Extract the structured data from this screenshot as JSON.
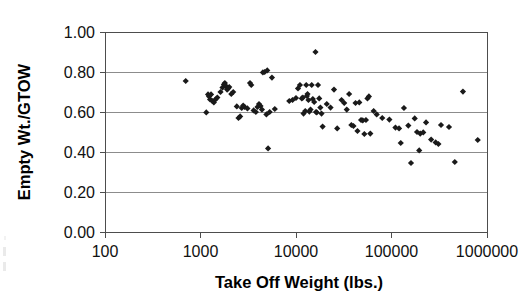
{
  "chart_data": {
    "type": "scatter",
    "title": "",
    "xlabel": "Take Off Weight (lbs.)",
    "ylabel": "Empty Wt./GTOW",
    "xscale": "log",
    "yscale": "linear",
    "xlim": [
      100,
      1000000
    ],
    "ylim": [
      0.0,
      1.0
    ],
    "xticks": [
      100,
      1000,
      10000,
      100000,
      1000000
    ],
    "xtick_labels": [
      "100",
      "1000",
      "10000",
      "100000",
      "1000000"
    ],
    "yticks": [
      0.0,
      0.2,
      0.4,
      0.6,
      0.8,
      1.0
    ],
    "ytick_labels": [
      "0.00",
      "0.20",
      "0.40",
      "0.60",
      "0.80",
      "1.00"
    ],
    "grid": "horizontal",
    "legend": "none",
    "marker": "filled-diamond",
    "marker_color": "#1a1a1a",
    "marker_size": 3.1,
    "series": [
      {
        "name": "Aircraft",
        "points": [
          [
            700,
            0.755
          ],
          [
            1150,
            0.598
          ],
          [
            1200,
            0.688
          ],
          [
            1230,
            0.678
          ],
          [
            1260,
            0.663
          ],
          [
            1290,
            0.688
          ],
          [
            1330,
            0.655
          ],
          [
            1380,
            0.648
          ],
          [
            1430,
            0.662
          ],
          [
            1500,
            0.672
          ],
          [
            1620,
            0.7
          ],
          [
            1700,
            0.722
          ],
          [
            1760,
            0.738
          ],
          [
            1800,
            0.745
          ],
          [
            1850,
            0.73
          ],
          [
            1900,
            0.712
          ],
          [
            1950,
            0.718
          ],
          [
            2000,
            0.725
          ],
          [
            2100,
            0.69
          ],
          [
            2200,
            0.7
          ],
          [
            2400,
            0.628
          ],
          [
            2500,
            0.57
          ],
          [
            2600,
            0.578
          ],
          [
            2700,
            0.62
          ],
          [
            2800,
            0.632
          ],
          [
            2900,
            0.625
          ],
          [
            3100,
            0.618
          ],
          [
            3300,
            0.745
          ],
          [
            3400,
            0.735
          ],
          [
            3600,
            0.608
          ],
          [
            3800,
            0.6
          ],
          [
            3950,
            0.625
          ],
          [
            4100,
            0.64
          ],
          [
            4250,
            0.63
          ],
          [
            4400,
            0.612
          ],
          [
            4500,
            0.798
          ],
          [
            4700,
            0.8
          ],
          [
            4900,
            0.588
          ],
          [
            5000,
            0.808
          ],
          [
            5100,
            0.418
          ],
          [
            5300,
            0.6
          ],
          [
            5600,
            0.772
          ],
          [
            6000,
            0.615
          ],
          [
            8500,
            0.655
          ],
          [
            9200,
            0.66
          ],
          [
            10000,
            0.67
          ],
          [
            10500,
            0.718
          ],
          [
            11000,
            0.735
          ],
          [
            11500,
            0.668
          ],
          [
            11800,
            0.672
          ],
          [
            12000,
            0.592
          ],
          [
            12500,
            0.605
          ],
          [
            12800,
            0.735
          ],
          [
            13000,
            0.68
          ],
          [
            13200,
            0.69
          ],
          [
            13500,
            0.66
          ],
          [
            13800,
            0.602
          ],
          [
            14200,
            0.612
          ],
          [
            14600,
            0.735
          ],
          [
            15000,
            0.665
          ],
          [
            15500,
            0.65
          ],
          [
            16000,
            0.9
          ],
          [
            16200,
            0.6
          ],
          [
            16500,
            0.598
          ],
          [
            17000,
            0.735
          ],
          [
            17500,
            0.668
          ],
          [
            18000,
            0.622
          ],
          [
            18500,
            0.592
          ],
          [
            19000,
            0.527
          ],
          [
            21000,
            0.64
          ],
          [
            23000,
            0.622
          ],
          [
            25000,
            0.712
          ],
          [
            27000,
            0.518
          ],
          [
            30000,
            0.66
          ],
          [
            32000,
            0.645
          ],
          [
            34000,
            0.612
          ],
          [
            36000,
            0.69
          ],
          [
            38000,
            0.535
          ],
          [
            40000,
            0.53
          ],
          [
            42000,
            0.645
          ],
          [
            44000,
            0.505
          ],
          [
            46000,
            0.648
          ],
          [
            48000,
            0.56
          ],
          [
            50000,
            0.558
          ],
          [
            52000,
            0.49
          ],
          [
            54000,
            0.56
          ],
          [
            56000,
            0.668
          ],
          [
            58000,
            0.678
          ],
          [
            60000,
            0.492
          ],
          [
            65000,
            0.605
          ],
          [
            70000,
            0.588
          ],
          [
            80000,
            0.57
          ],
          [
            95000,
            0.562
          ],
          [
            110000,
            0.522
          ],
          [
            120000,
            0.518
          ],
          [
            125000,
            0.445
          ],
          [
            135000,
            0.62
          ],
          [
            150000,
            0.532
          ],
          [
            160000,
            0.345
          ],
          [
            175000,
            0.568
          ],
          [
            185000,
            0.5
          ],
          [
            195000,
            0.408
          ],
          [
            200000,
            0.492
          ],
          [
            215000,
            0.498
          ],
          [
            230000,
            0.548
          ],
          [
            260000,
            0.462
          ],
          [
            290000,
            0.448
          ],
          [
            310000,
            0.44
          ],
          [
            330000,
            0.535
          ],
          [
            400000,
            0.525
          ],
          [
            460000,
            0.35
          ],
          [
            560000,
            0.702
          ],
          [
            800000,
            0.46
          ]
        ]
      }
    ]
  },
  "axes": {
    "plot_left_px": 105,
    "plot_right_px": 487,
    "plot_top_px": 32,
    "plot_bottom_px": 232
  }
}
